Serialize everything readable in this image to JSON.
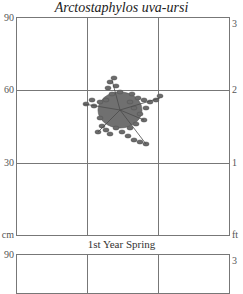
{
  "title": "Arctostaphylos uva-ursi",
  "season_label": "1st Year Spring",
  "plot": {
    "left_axis": {
      "unit": "cm",
      "ticks": [
        "90",
        "60",
        "30"
      ]
    },
    "right_axis": {
      "unit": "ft",
      "ticks": [
        "3",
        "2",
        "1"
      ]
    },
    "grid": {
      "columns": 3,
      "rows": 3
    }
  },
  "plot2": {
    "left_axis": {
      "ticks": [
        "90"
      ]
    },
    "right_axis": {
      "ticks": [
        "3"
      ]
    }
  },
  "plant": {
    "name": "Arctostaphylos uva-ursi",
    "color": "#6b6b6b"
  }
}
